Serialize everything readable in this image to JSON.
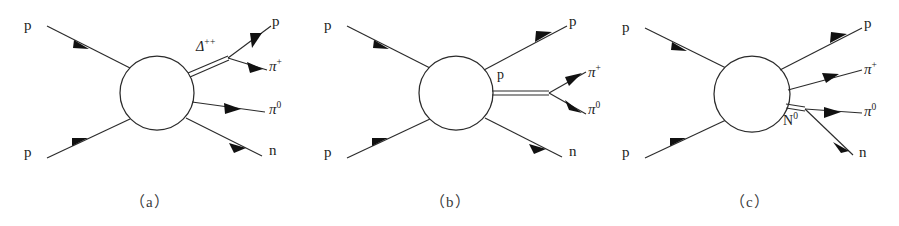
{
  "figure": {
    "background_color": "#ffffff",
    "line_color": "#2b2b2b",
    "panel_count": 3
  },
  "panels": [
    {
      "id": "panel-a",
      "caption": "（a）",
      "blob_label": "",
      "propagator": {
        "label": "Δ",
        "charge": "++",
        "name": "delta-plus-plus"
      },
      "incoming": [
        {
          "name": "incoming-proton-top",
          "label": "p"
        },
        {
          "name": "incoming-proton-bottom",
          "label": "p"
        }
      ],
      "outgoing": [
        {
          "name": "outgoing-proton",
          "label": "p",
          "charge": ""
        },
        {
          "name": "outgoing-pion-plus",
          "label": "π",
          "charge": "+"
        },
        {
          "name": "outgoing-pion-zero",
          "label": "π",
          "charge": "0"
        },
        {
          "name": "outgoing-neutron",
          "label": "n",
          "charge": ""
        }
      ]
    },
    {
      "id": "panel-b",
      "caption": "（b）",
      "propagator": {
        "label": "p",
        "charge": "",
        "name": "proton-propagator"
      },
      "incoming": [
        {
          "name": "incoming-proton-top",
          "label": "p"
        },
        {
          "name": "incoming-proton-bottom",
          "label": "p"
        }
      ],
      "outgoing": [
        {
          "name": "outgoing-proton",
          "label": "p",
          "charge": ""
        },
        {
          "name": "outgoing-pion-plus",
          "label": "π",
          "charge": "+"
        },
        {
          "name": "outgoing-pion-zero",
          "label": "π",
          "charge": "0"
        },
        {
          "name": "outgoing-neutron",
          "label": "n",
          "charge": ""
        }
      ]
    },
    {
      "id": "panel-c",
      "caption": "（c）",
      "propagator": {
        "label": "N",
        "charge": "0",
        "name": "n-zero-resonance"
      },
      "incoming": [
        {
          "name": "incoming-proton-top",
          "label": "p"
        },
        {
          "name": "incoming-proton-bottom",
          "label": "p"
        }
      ],
      "outgoing": [
        {
          "name": "outgoing-proton",
          "label": "p",
          "charge": ""
        },
        {
          "name": "outgoing-pion-plus",
          "label": "π",
          "charge": "+"
        },
        {
          "name": "outgoing-pion-zero",
          "label": "π",
          "charge": "0"
        },
        {
          "name": "outgoing-neutron",
          "label": "n",
          "charge": ""
        }
      ]
    }
  ]
}
